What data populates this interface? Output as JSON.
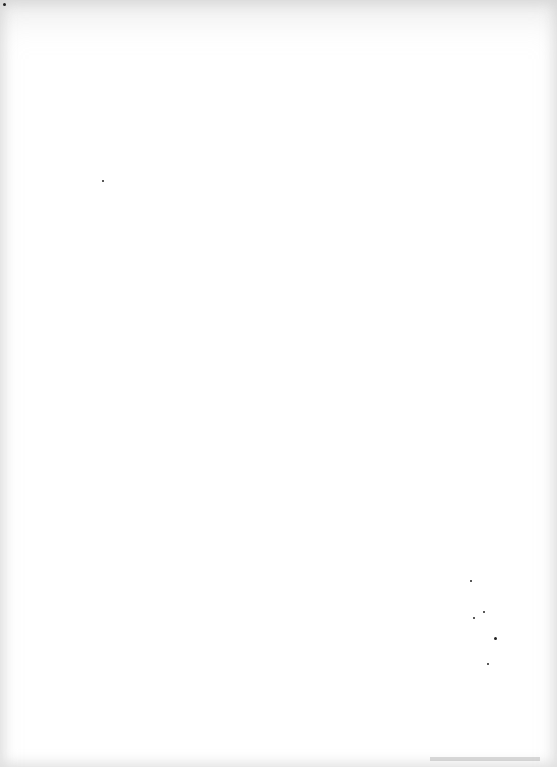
{
  "page": {
    "type": "blank-scanned-page",
    "background": "#ffffff",
    "specks": [
      {
        "x": 470,
        "y": 580,
        "r": 1
      },
      {
        "x": 473,
        "y": 617,
        "r": 1
      },
      {
        "x": 483,
        "y": 611,
        "r": 1.2
      },
      {
        "x": 494,
        "y": 637,
        "r": 1.5
      },
      {
        "x": 487,
        "y": 663,
        "r": 1
      },
      {
        "x": 102,
        "y": 180,
        "r": 1
      },
      {
        "x": 3,
        "y": 3,
        "r": 1.5
      }
    ]
  }
}
